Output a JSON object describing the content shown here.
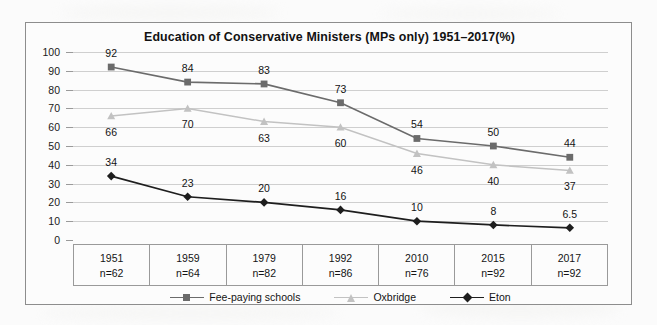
{
  "chart_data": {
    "type": "line",
    "title": "Education of Conservative Ministers (MPs only) 1951–2017(%)",
    "xlabel": "",
    "ylabel": "",
    "ylim": [
      0,
      100
    ],
    "ytick_step": 10,
    "yticks": [
      "100",
      "90",
      "80",
      "70",
      "60",
      "50",
      "40",
      "30",
      "20",
      "10",
      "0"
    ],
    "grid": true,
    "legend_position": "bottom",
    "categories": [
      "1951",
      "1959",
      "1979",
      "1992",
      "2010",
      "2015",
      "2017"
    ],
    "category_sublabels": [
      "n=62",
      "n=64",
      "n=82",
      "n=86",
      "n=76",
      "n=92",
      "n=92"
    ],
    "series": [
      {
        "name": "Fee-paying schools",
        "marker": "square",
        "color": "#6b6b6b",
        "label_position": "above",
        "values": [
          92,
          84,
          83,
          73,
          54,
          50,
          44
        ],
        "labels": [
          "92",
          "84",
          "83",
          "73",
          "54",
          "50",
          "44"
        ]
      },
      {
        "name": "Oxbridge",
        "marker": "triangle",
        "color": "#c2c2c2",
        "label_position": "below",
        "values": [
          66,
          70,
          63,
          60,
          46,
          40,
          37
        ],
        "labels": [
          "66",
          "70",
          "63",
          "60",
          "46",
          "40",
          "37"
        ]
      },
      {
        "name": "Eton",
        "marker": "diamond",
        "color": "#1e1e1e",
        "label_position": "above",
        "values": [
          34,
          23,
          20,
          16,
          10,
          8,
          6.5
        ],
        "labels": [
          "34",
          "23",
          "20",
          "16",
          "10",
          "8",
          "6.5"
        ]
      }
    ]
  },
  "colors": {
    "fee_paying": "#6b6b6b",
    "oxbridge": "#c2c2c2",
    "eton": "#1e1e1e",
    "grid": "#cfcfcf",
    "frame": "#8d8d8d"
  }
}
